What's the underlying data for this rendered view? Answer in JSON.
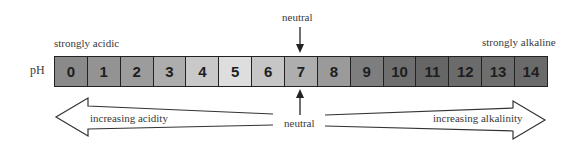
{
  "diagram": {
    "axis_label": "pH",
    "left_end_label": "strongly acidic",
    "right_end_label": "strongly alkaline",
    "neutral_top_label": "neutral",
    "neutral_bottom_label": "neutral",
    "left_arrow_label": "increasing acidity",
    "right_arrow_label": "increasing alkalinity",
    "cells": [
      {
        "value": "0",
        "color": "#8a8a8a"
      },
      {
        "value": "1",
        "color": "#939393"
      },
      {
        "value": "2",
        "color": "#9c9c9c"
      },
      {
        "value": "3",
        "color": "#adadad"
      },
      {
        "value": "4",
        "color": "#c9c9c9"
      },
      {
        "value": "5",
        "color": "#dedede"
      },
      {
        "value": "6",
        "color": "#c6c6c6"
      },
      {
        "value": "7",
        "color": "#aeaeae"
      },
      {
        "value": "8",
        "color": "#9a9a9a"
      },
      {
        "value": "9",
        "color": "#7e7e7e"
      },
      {
        "value": "10",
        "color": "#6f6f6f"
      },
      {
        "value": "11",
        "color": "#666666"
      },
      {
        "value": "12",
        "color": "#6b6b6b"
      },
      {
        "value": "13",
        "color": "#6e6e6e"
      },
      {
        "value": "14",
        "color": "#6a6a6a"
      }
    ]
  }
}
